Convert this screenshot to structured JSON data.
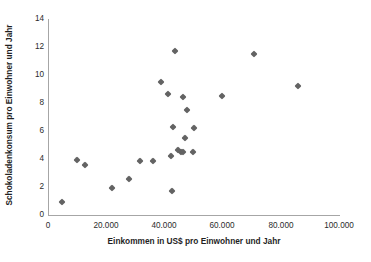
{
  "chart_data": {
    "type": "scatter",
    "title": "",
    "xlabel": "Einkommen in US$ pro Einwohner und Jahr",
    "ylabel": "Schokoladenkonsum  pro Einwohner und Jahr",
    "xlim": [
      0,
      100000
    ],
    "ylim": [
      0,
      14
    ],
    "xticks": [
      0,
      20000,
      40000,
      60000,
      80000,
      100000
    ],
    "xticklabels": [
      "0",
      "20.000",
      "40.000",
      "60.000",
      "80.000",
      "100.000"
    ],
    "yticks": [
      0,
      2,
      4,
      6,
      8,
      10,
      12,
      14
    ],
    "yticklabels": [
      "0",
      "2",
      "4",
      "6",
      "8",
      "10",
      "12",
      "14"
    ],
    "grid": false,
    "legend": false,
    "marker": "diamond",
    "marker_color": "#636363",
    "series": [
      {
        "name": "Länder",
        "points": [
          {
            "x": 4800,
            "y": 0.9
          },
          {
            "x": 10000,
            "y": 3.95
          },
          {
            "x": 12800,
            "y": 3.6
          },
          {
            "x": 22000,
            "y": 1.95
          },
          {
            "x": 27600,
            "y": 2.55
          },
          {
            "x": 31400,
            "y": 3.85
          },
          {
            "x": 36000,
            "y": 3.85
          },
          {
            "x": 38800,
            "y": 9.5
          },
          {
            "x": 41000,
            "y": 8.65
          },
          {
            "x": 42000,
            "y": 4.25
          },
          {
            "x": 42400,
            "y": 1.7
          },
          {
            "x": 42800,
            "y": 6.3
          },
          {
            "x": 43600,
            "y": 11.75
          },
          {
            "x": 44600,
            "y": 4.65
          },
          {
            "x": 45400,
            "y": 4.5
          },
          {
            "x": 46200,
            "y": 4.5
          },
          {
            "x": 46400,
            "y": 8.4
          },
          {
            "x": 47000,
            "y": 5.5
          },
          {
            "x": 47600,
            "y": 7.5
          },
          {
            "x": 49600,
            "y": 4.5
          },
          {
            "x": 50000,
            "y": 6.25
          },
          {
            "x": 59500,
            "y": 8.5
          },
          {
            "x": 70500,
            "y": 11.5
          },
          {
            "x": 85500,
            "y": 9.2
          }
        ]
      }
    ]
  },
  "axes": {
    "x_title": "Einkommen in US$ pro Einwohner und Jahr",
    "y_title": "Schokoladenkonsum  pro Einwohner und Jahr"
  },
  "colors": {
    "marker": "#636363",
    "axis": "#a6a6a6",
    "text": "#1f1f1f"
  }
}
